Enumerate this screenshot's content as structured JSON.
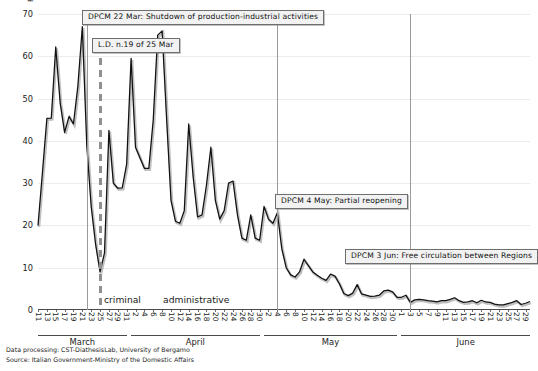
{
  "chart_data": {
    "type": "line",
    "title": "",
    "xlabel": "",
    "ylabel": "FINED or REPORTED INDIVIDUALS carried out by the Police",
    "ylim": [
      0,
      70
    ],
    "yticks": [
      0,
      10,
      20,
      30,
      40,
      50,
      60,
      70
    ],
    "grid": true,
    "legend_position": "none",
    "line_color": "#111111",
    "x_start_label": "11 March",
    "x_end_label": "30 June",
    "month_groups": [
      {
        "label": "March",
        "first_day": 11,
        "last_day": 31,
        "tick_days": [
          11,
          13,
          15,
          17,
          19,
          21,
          23,
          25,
          27,
          29,
          31
        ]
      },
      {
        "label": "April",
        "first_day": 1,
        "last_day": 30,
        "tick_days": [
          2,
          4,
          6,
          8,
          10,
          12,
          14,
          16,
          18,
          20,
          22,
          24,
          26,
          28,
          30
        ]
      },
      {
        "label": "May",
        "first_day": 1,
        "last_day": 31,
        "tick_days": [
          2,
          4,
          6,
          8,
          10,
          12,
          14,
          16,
          18,
          20,
          22,
          24,
          26,
          28,
          30
        ]
      },
      {
        "label": "June",
        "first_day": 1,
        "last_day": 30,
        "tick_days": [
          1,
          3,
          5,
          7,
          9,
          11,
          13,
          15,
          17,
          19,
          21,
          23,
          25,
          27,
          29
        ]
      }
    ],
    "series": [
      {
        "name": "Fined or reported individuals",
        "x": [
          "Mar 11",
          "Mar 12",
          "Mar 13",
          "Mar 14",
          "Mar 15",
          "Mar 16",
          "Mar 17",
          "Mar 18",
          "Mar 19",
          "Mar 20",
          "Mar 21",
          "Mar 22",
          "Mar 23",
          "Mar 24",
          "Mar 25",
          "Mar 26",
          "Mar 27",
          "Mar 28",
          "Mar 29",
          "Mar 30",
          "Mar 31",
          "Apr 1",
          "Apr 2",
          "Apr 3",
          "Apr 4",
          "Apr 5",
          "Apr 6",
          "Apr 7",
          "Apr 8",
          "Apr 9",
          "Apr 10",
          "Apr 11",
          "Apr 12",
          "Apr 13",
          "Apr 14",
          "Apr 15",
          "Apr 16",
          "Apr 17",
          "Apr 18",
          "Apr 19",
          "Apr 20",
          "Apr 21",
          "Apr 22",
          "Apr 23",
          "Apr 24",
          "Apr 25",
          "Apr 26",
          "Apr 27",
          "Apr 28",
          "Apr 29",
          "Apr 30",
          "May 1",
          "May 2",
          "May 3",
          "May 4",
          "May 5",
          "May 6",
          "May 7",
          "May 8",
          "May 9",
          "May 10",
          "May 11",
          "May 12",
          "May 13",
          "May 14",
          "May 15",
          "May 16",
          "May 17",
          "May 18",
          "May 19",
          "May 20",
          "May 21",
          "May 22",
          "May 23",
          "May 24",
          "May 25",
          "May 26",
          "May 27",
          "May 28",
          "May 29",
          "May 30",
          "May 31",
          "Jun 1",
          "Jun 2",
          "Jun 3",
          "Jun 4",
          "Jun 5",
          "Jun 6",
          "Jun 7",
          "Jun 8",
          "Jun 9",
          "Jun 10",
          "Jun 11",
          "Jun 12",
          "Jun 13",
          "Jun 14",
          "Jun 15",
          "Jun 16",
          "Jun 17",
          "Jun 18",
          "Jun 19",
          "Jun 20",
          "Jun 21",
          "Jun 22",
          "Jun 23",
          "Jun 24",
          "Jun 25",
          "Jun 26",
          "Jun 27",
          "Jun 28",
          "Jun 29",
          "Jun 30"
        ],
        "values": [
          20.0,
          32.5,
          45.3,
          45.4,
          62.2,
          49.0,
          42.0,
          45.8,
          44.0,
          53.0,
          67.0,
          39.0,
          24.5,
          15.5,
          9.0,
          13.5,
          42.5,
          30.0,
          28.8,
          28.9,
          34.5,
          59.5,
          38.5,
          36.0,
          33.5,
          33.5,
          45.0,
          65.0,
          66.0,
          45.5,
          26.0,
          21.0,
          20.5,
          23.5,
          44.0,
          31.5,
          22.0,
          22.5,
          29.5,
          38.5,
          26.0,
          21.5,
          23.5,
          30.0,
          30.5,
          22.5,
          17.0,
          16.5,
          22.5,
          17.0,
          16.5,
          24.5,
          21.5,
          20.5,
          23.0,
          14.5,
          10.0,
          8.3,
          7.8,
          9.0,
          12.0,
          10.5,
          9.0,
          8.2,
          7.5,
          7.0,
          8.5,
          8.0,
          6.2,
          3.9,
          3.4,
          4.0,
          6.0,
          3.8,
          3.5,
          3.2,
          3.3,
          3.5,
          4.5,
          4.7,
          4.3,
          3.0,
          3.0,
          3.5,
          1.8,
          2.4,
          2.5,
          2.4,
          2.2,
          2.1,
          1.9,
          2.2,
          2.2,
          2.5,
          2.9,
          2.2,
          1.8,
          1.9,
          2.2,
          1.7,
          2.3,
          1.9,
          1.8,
          1.4,
          1.2,
          1.2,
          1.5,
          1.8,
          2.2,
          1.3,
          1.6,
          2.0
        ]
      }
    ],
    "annotations": [
      {
        "id": "ann-shutdown",
        "text": "DPCM 22 Mar: Shutdown of production-industrial activities",
        "anchor_x": "Mar 22",
        "style": "solid"
      },
      {
        "id": "ann-ld19",
        "text": "L.D. n.19 of 25 Mar",
        "anchor_x": "Mar 25",
        "style": "dashed"
      },
      {
        "id": "ann-reopening",
        "text": "DPCM 4 May: Partial reopening",
        "anchor_x": "May 4",
        "style": "solid"
      },
      {
        "id": "ann-free-movement",
        "text": "DPCM 3 Jun: Free circulation between Regions",
        "anchor_x": "Jun 3",
        "style": "solid"
      }
    ],
    "regime_labels": [
      {
        "id": "regime-criminal",
        "text": "criminal"
      },
      {
        "id": "regime-administrative",
        "text": "administrative"
      }
    ]
  },
  "credits": {
    "line1": "Data processing: CST-DiathesisLab, University of Bergamo",
    "line2": "Source: Italian Government-Ministry of the Domestic Affairs"
  }
}
